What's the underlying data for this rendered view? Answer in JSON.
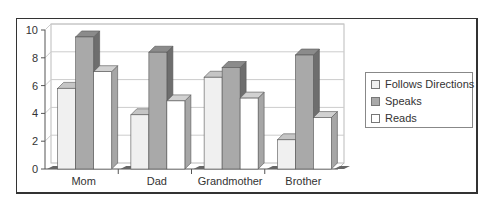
{
  "chart_data": {
    "type": "bar",
    "style": "3d-clustered",
    "title": "",
    "xlabel": "",
    "ylabel": "",
    "categories": [
      "Mom",
      "Dad",
      "Grandmother",
      "Brother"
    ],
    "series": [
      {
        "name": "Follows Directions",
        "values": [
          5.8,
          3.9,
          6.6,
          2.1
        ],
        "color": "#f0f0f0"
      },
      {
        "name": "Speaks",
        "values": [
          9.5,
          8.4,
          7.3,
          8.2
        ],
        "color": "#a9a9a9"
      },
      {
        "name": "Reads",
        "values": [
          7.0,
          4.9,
          5.1,
          3.7
        ],
        "color": "#ffffff"
      }
    ],
    "ylim": [
      0,
      10
    ],
    "yticks": [
      0,
      2,
      4,
      6,
      8,
      10
    ],
    "grid": true,
    "legend_position": "right"
  },
  "legend": {
    "items": [
      "Follows Directions",
      "Speaks",
      "Reads"
    ]
  }
}
